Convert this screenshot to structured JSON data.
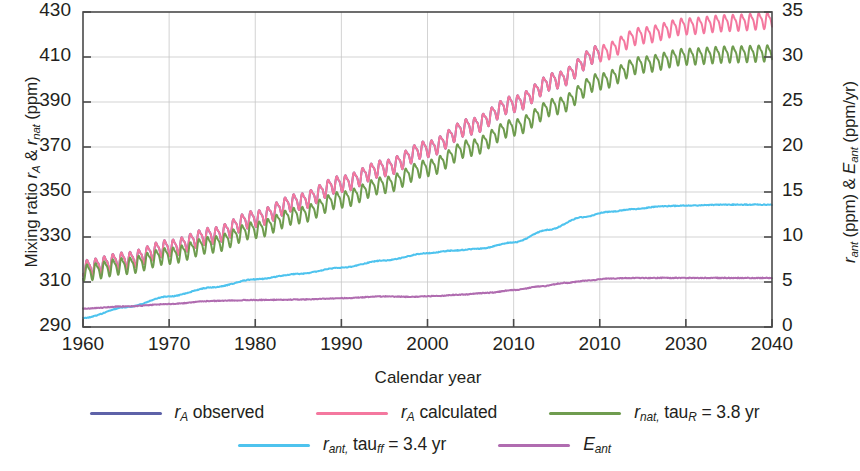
{
  "chart_data": {
    "type": "line",
    "title": "",
    "xlabel": "Calendar year",
    "ylabel_left": "Mixing ratio rA & rnat (ppm)",
    "ylabel_right": "rant (ppm) & Eant (ppm/yr)",
    "xlim": [
      1960,
      2040
    ],
    "ylim_left": [
      290,
      430
    ],
    "ylim_right": [
      0,
      35
    ],
    "xticks": [
      1960,
      1970,
      1980,
      1990,
      2000,
      2010,
      2010,
      2030,
      2040
    ],
    "xtick_labels": [
      "1960",
      "1970",
      "1980",
      "1990",
      "2000",
      "2010",
      "2010",
      "2030",
      "2040"
    ],
    "xtick_positions": [
      1960,
      1970,
      1980,
      1990,
      2000,
      2010,
      2020,
      2030,
      2040
    ],
    "yticks_left": [
      290,
      310,
      330,
      350,
      370,
      390,
      410,
      430
    ],
    "ytick_labels_left": [
      "290",
      "310",
      "330",
      "350",
      "370",
      "390",
      "410",
      "430"
    ],
    "yticks_right": [
      0,
      5,
      10,
      15,
      20,
      25,
      30,
      35
    ],
    "ytick_labels_right": [
      "0",
      "5",
      "10",
      "15",
      "20",
      "25",
      "30",
      "35"
    ],
    "grid": true,
    "legend_position": "below",
    "series": [
      {
        "name": "r_A observed",
        "axis": "left",
        "color": "#5e62a8",
        "x_start": 1960,
        "x_end": 2020,
        "seasonal_amplitude": 3.2,
        "anchors_x": [
          1960,
          1965,
          1970,
          1975,
          1980,
          1985,
          1990,
          1995,
          2000,
          2005,
          2010,
          2015,
          2020
        ],
        "anchors_y": [
          316.5,
          320.0,
          325.5,
          331.0,
          338.5,
          346.0,
          354.0,
          361.0,
          369.5,
          379.5,
          389.5,
          400.0,
          412.0
        ]
      },
      {
        "name": "r_A calculated",
        "axis": "left",
        "color": "#f4789f",
        "x_start": 1960,
        "x_end": 2040,
        "seasonal_amplitude": 3.2,
        "anchors_x": [
          1960,
          1965,
          1970,
          1975,
          1980,
          1985,
          1990,
          1995,
          2000,
          2005,
          2010,
          2015,
          2020,
          2025,
          2030,
          2035,
          2040
        ],
        "anchors_y": [
          316.5,
          320.0,
          325.5,
          331.0,
          338.5,
          346.0,
          354.0,
          361.0,
          369.5,
          379.5,
          389.5,
          400.0,
          412.0,
          420.0,
          424.0,
          425.5,
          426.5
        ]
      },
      {
        "name": "r_nat, tau_R = 3.8 yr",
        "axis": "left",
        "color": "#6f9c4f",
        "x_start": 1960,
        "x_end": 2040,
        "seasonal_amplitude": 3.2,
        "anchors_x": [
          1960,
          1965,
          1970,
          1975,
          1980,
          1985,
          1990,
          1995,
          2000,
          2005,
          2010,
          2015,
          2020,
          2025,
          2030,
          2035,
          2040
        ],
        "anchors_y": [
          314.5,
          317.5,
          322.0,
          327.0,
          333.5,
          340.0,
          347.0,
          353.5,
          361.0,
          370.0,
          379.0,
          388.5,
          399.5,
          407.0,
          410.5,
          411.5,
          412.0
        ]
      },
      {
        "name": "r_ant, tau_ff = 3.4 yr",
        "axis": "right",
        "color": "#4ec3ee",
        "x_start": 1960,
        "x_end": 2040,
        "seasonal_amplitude": 0,
        "anchors_x": [
          1960,
          1965,
          1970,
          1975,
          1980,
          1985,
          1990,
          1995,
          2000,
          2003,
          2006,
          2010,
          2014,
          2018,
          2021,
          2024,
          2027,
          2030,
          2035,
          2040
        ],
        "anchors_y": [
          1.0,
          2.2,
          3.4,
          4.4,
          5.3,
          5.9,
          6.6,
          7.4,
          8.2,
          8.5,
          8.7,
          9.4,
          10.8,
          12.2,
          12.8,
          13.1,
          13.4,
          13.5,
          13.6,
          13.6
        ]
      },
      {
        "name": "E_ant",
        "axis": "right",
        "color": "#b06cb0",
        "x_start": 1960,
        "x_end": 2040,
        "seasonal_amplitude": 0,
        "anchors_x": [
          1960,
          1965,
          1970,
          1975,
          1980,
          1985,
          1990,
          1995,
          1998,
          2001,
          2004,
          2007,
          2010,
          2013,
          2016,
          2019,
          2021,
          2024,
          2028,
          2032,
          2036,
          2040
        ],
        "anchors_y": [
          2.05,
          2.3,
          2.55,
          2.9,
          3.0,
          3.05,
          3.2,
          3.4,
          3.35,
          3.45,
          3.6,
          3.8,
          4.1,
          4.5,
          4.9,
          5.2,
          5.4,
          5.45,
          5.45,
          5.45,
          5.45,
          5.45
        ]
      }
    ]
  },
  "axes": {
    "left_title_parts": {
      "pre": "Mixing ratio ",
      "r1": "r",
      "sub1": "A",
      "amp": " & ",
      "r2": "r",
      "sub2": "nat",
      "post": " (ppm)"
    },
    "right_title_parts": {
      "r1": "r",
      "sub1": "ant",
      "mid": " (ppm) & ",
      "e1": "E",
      "sub2": "ant",
      "post": " (ppm/yr)"
    },
    "bottom_title": "Calendar year"
  },
  "legend": {
    "entries": [
      {
        "id": "ra-observed",
        "color": "#5e62a8",
        "parts": {
          "main": "r",
          "sub": "A",
          "tail": " observed"
        }
      },
      {
        "id": "ra-calculated",
        "color": "#f4789f",
        "parts": {
          "main": "r",
          "sub": "A",
          "tail": " calculated"
        }
      },
      {
        "id": "rnat-tau-r",
        "color": "#6f9c4f",
        "parts": {
          "main": "r",
          "sub": "nat,",
          "tail": " tau",
          "sub2": "R",
          "tail2": " = 3.8 yr"
        }
      },
      {
        "id": "rant-tau-ff",
        "color": "#4ec3ee",
        "parts": {
          "main": "r",
          "sub": "ant,",
          "tail": " tau",
          "sub2": "ff",
          "tail2": " = 3.4 yr"
        }
      },
      {
        "id": "eant",
        "color": "#b06cb0",
        "parts": {
          "main": "E",
          "sub": "ant",
          "tail": ""
        }
      }
    ]
  },
  "colors": {
    "ra_observed": "#5e62a8",
    "ra_calculated": "#f4789f",
    "rnat": "#6f9c4f",
    "rant": "#4ec3ee",
    "eant": "#b06cb0",
    "frame": "#4a4a4a",
    "grid": "#c8c8c8",
    "text": "#231f20"
  }
}
